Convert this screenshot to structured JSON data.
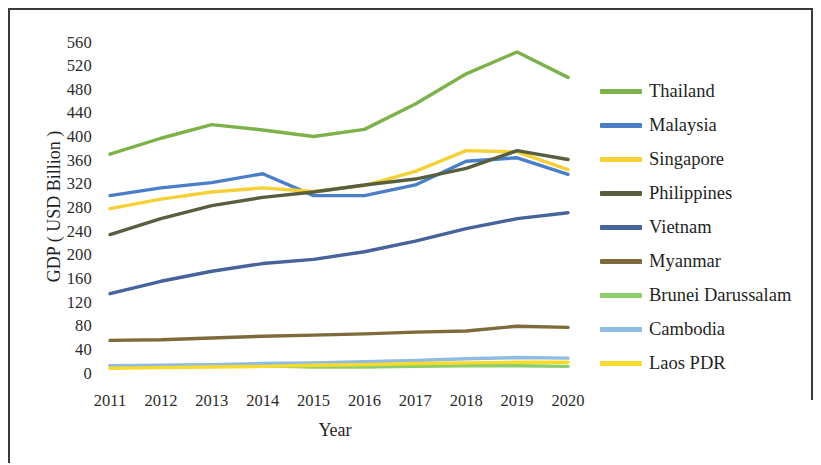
{
  "chart_data": {
    "type": "line",
    "title": "",
    "xlabel": "Year",
    "ylabel": "GDP ( USD Billion )",
    "categories": [
      "2011",
      "2012",
      "2013",
      "2014",
      "2015",
      "2016",
      "2017",
      "2018",
      "2019",
      "2020"
    ],
    "x": [
      2011,
      2012,
      2013,
      2014,
      2015,
      2016,
      2017,
      2018,
      2019,
      2020
    ],
    "ylim": [
      0,
      570
    ],
    "yticks": [
      0,
      40,
      80,
      120,
      160,
      200,
      240,
      280,
      320,
      360,
      400,
      440,
      480,
      520,
      560
    ],
    "ytick_labels": [
      "0",
      "40",
      "80",
      "120",
      "160",
      "200",
      "240",
      "280",
      "320",
      "360",
      "400",
      "440",
      "480",
      "520",
      "560"
    ],
    "grid": false,
    "legend_position": "right",
    "series": [
      {
        "name": "Thailand",
        "color": "#7cb249",
        "values": [
          371,
          398,
          421,
          412,
          401,
          413,
          456,
          507,
          544,
          501
        ]
      },
      {
        "name": "Malaysia",
        "color": "#4a7ec8",
        "values": [
          301,
          314,
          323,
          338,
          301,
          301,
          319,
          359,
          365,
          337
        ]
      },
      {
        "name": "Singapore",
        "color": "#f5d036",
        "values": [
          279,
          295,
          307,
          314,
          308,
          318,
          342,
          377,
          375,
          345
        ]
      },
      {
        "name": "Philippines",
        "color": "#575f3f",
        "values": [
          235,
          262,
          284,
          298,
          307,
          319,
          329,
          347,
          377,
          362
        ]
      },
      {
        "name": "Vietnam",
        "color": "#47639c",
        "values": [
          135,
          156,
          173,
          186,
          193,
          206,
          224,
          245,
          262,
          272
        ]
      },
      {
        "name": "Myanmar",
        "color": "#7d6b3b",
        "values": [
          56,
          57,
          60,
          63,
          65,
          67,
          70,
          72,
          80,
          78
        ]
      },
      {
        "name": "Brunei Darussalam",
        "color": "#8ece6a",
        "values": [
          13,
          13,
          14,
          13,
          11,
          11,
          12,
          13,
          13,
          12
        ]
      },
      {
        "name": "Cambodia",
        "color": "#8fbce4",
        "values": [
          13,
          14,
          15,
          17,
          18,
          20,
          22,
          25,
          27,
          26
        ]
      },
      {
        "name": "Laos PDR",
        "color": "#fada2b",
        "values": [
          9,
          10,
          11,
          12,
          14,
          15,
          17,
          18,
          19,
          19
        ]
      }
    ]
  },
  "legend": {
    "items": [
      {
        "label": "Thailand",
        "color": "#7cb249"
      },
      {
        "label": "Malaysia",
        "color": "#4a7ec8"
      },
      {
        "label": "Singapore",
        "color": "#f5d036"
      },
      {
        "label": "Philippines",
        "color": "#575f3f"
      },
      {
        "label": "Vietnam",
        "color": "#47639c"
      },
      {
        "label": "Myanmar",
        "color": "#7d6b3b"
      },
      {
        "label": "Brunei Darussalam",
        "color": "#8ece6a"
      },
      {
        "label": "Cambodia",
        "color": "#8fbce4"
      },
      {
        "label": "Laos PDR",
        "color": "#fada2b"
      }
    ]
  }
}
